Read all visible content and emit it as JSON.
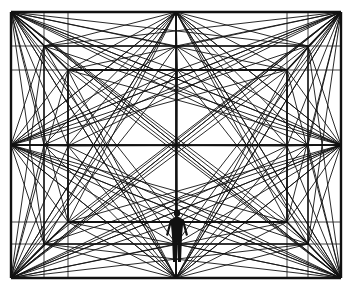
{
  "illustration": {
    "title": "Perspective room of radiating lines with human figure",
    "colors": {
      "background": "#ffffff",
      "line": "#111111"
    },
    "outer": [
      11,
      12,
      341,
      278
    ],
    "middle": [
      44,
      46,
      308,
      244
    ],
    "inner": [
      68,
      70,
      287,
      222
    ],
    "figure": {
      "x": 177,
      "y_head": 210,
      "height": 52
    }
  }
}
